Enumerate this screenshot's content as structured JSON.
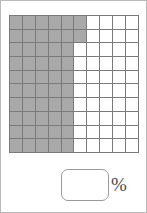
{
  "exercise": {
    "type": "percent-grid-shading",
    "grid": {
      "rows": 10,
      "columns": 10,
      "total_cells": 100,
      "shaded_cells": 52,
      "shaded_per_row": [
        6,
        6,
        5,
        5,
        5,
        5,
        5,
        5,
        5,
        5
      ],
      "shaded_color": "#a9a9a9",
      "unshaded_color": "#ffffff",
      "gridline_color": "#7a7a7a",
      "border_color": "#6a6a6a"
    },
    "answer": {
      "value": "",
      "placeholder": "",
      "unit_label": "%"
    }
  },
  "chart_data": {
    "type": "heatmap",
    "title": "",
    "xlabel": "",
    "ylabel": "",
    "categories": [
      "1",
      "2",
      "3",
      "4",
      "5",
      "6",
      "7",
      "8",
      "9",
      "10"
    ],
    "rows": [
      "1",
      "2",
      "3",
      "4",
      "5",
      "6",
      "7",
      "8",
      "9",
      "10"
    ],
    "values": [
      [
        1,
        1,
        1,
        1,
        1,
        1,
        0,
        0,
        0,
        0
      ],
      [
        1,
        1,
        1,
        1,
        1,
        1,
        0,
        0,
        0,
        0
      ],
      [
        1,
        1,
        1,
        1,
        1,
        0,
        0,
        0,
        0,
        0
      ],
      [
        1,
        1,
        1,
        1,
        1,
        0,
        0,
        0,
        0,
        0
      ],
      [
        1,
        1,
        1,
        1,
        1,
        0,
        0,
        0,
        0,
        0
      ],
      [
        1,
        1,
        1,
        1,
        1,
        0,
        0,
        0,
        0,
        0
      ],
      [
        1,
        1,
        1,
        1,
        1,
        0,
        0,
        0,
        0,
        0
      ],
      [
        1,
        1,
        1,
        1,
        1,
        0,
        0,
        0,
        0,
        0
      ],
      [
        1,
        1,
        1,
        1,
        1,
        0,
        0,
        0,
        0,
        0
      ],
      [
        1,
        1,
        1,
        1,
        1,
        0,
        0,
        0,
        0,
        0
      ]
    ],
    "shaded_count": 52,
    "total_count": 100,
    "legend": [
      "shaded",
      "unshaded"
    ],
    "grid": true
  }
}
